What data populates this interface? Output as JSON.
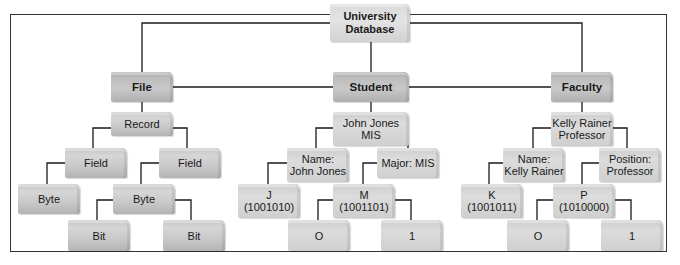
{
  "diagram": {
    "root": {
      "id": "root",
      "label": "University\nDatabase"
    },
    "nodes": {
      "file": {
        "label": "File"
      },
      "student": {
        "label": "Student"
      },
      "faculty": {
        "label": "Faculty"
      },
      "record": {
        "label": "Record"
      },
      "student_record": {
        "label": "John Jones\nMIS"
      },
      "faculty_record": {
        "label": "Kelly Rainer\nProfessor"
      },
      "field_left": {
        "label": "Field"
      },
      "field_right": {
        "label": "Field"
      },
      "student_name_field": {
        "label": "Name:\nJohn Jones"
      },
      "student_major_field": {
        "label": "Major: MIS"
      },
      "faculty_name_field": {
        "label": "Name:\nKelly Rainer"
      },
      "faculty_position_field": {
        "label": "Position:\nProfessor"
      },
      "byte_left": {
        "label": "Byte"
      },
      "byte_mid": {
        "label": "Byte"
      },
      "byte_j": {
        "label": "J\n(1001010)"
      },
      "byte_m": {
        "label": "M\n(1001101)"
      },
      "byte_k": {
        "label": "K\n(1001011)"
      },
      "byte_p": {
        "label": "P\n(1010000)"
      },
      "bit_left": {
        "label": "Bit"
      },
      "bit_right": {
        "label": "Bit"
      },
      "bit_m0": {
        "label": "O"
      },
      "bit_m1": {
        "label": "1"
      },
      "bit_p0": {
        "label": "O"
      },
      "bit_p1": {
        "label": "1"
      }
    },
    "edges": [
      [
        "root",
        "file"
      ],
      [
        "root",
        "student"
      ],
      [
        "root",
        "faculty"
      ],
      [
        "file",
        "record"
      ],
      [
        "record",
        "field_left"
      ],
      [
        "record",
        "field_right"
      ],
      [
        "field_left",
        "byte_left"
      ],
      [
        "field_right",
        "byte_mid"
      ],
      [
        "byte_mid",
        "bit_left"
      ],
      [
        "byte_mid",
        "bit_right"
      ],
      [
        "student",
        "student_record"
      ],
      [
        "student_record",
        "student_name_field"
      ],
      [
        "student_record",
        "student_major_field"
      ],
      [
        "student_name_field",
        "byte_j"
      ],
      [
        "student_major_field",
        "byte_m"
      ],
      [
        "byte_m",
        "bit_m0"
      ],
      [
        "byte_m",
        "bit_m1"
      ],
      [
        "faculty",
        "faculty_record"
      ],
      [
        "faculty_record",
        "faculty_name_field"
      ],
      [
        "faculty_record",
        "faculty_position_field"
      ],
      [
        "faculty_name_field",
        "byte_k"
      ],
      [
        "faculty_position_field",
        "byte_p"
      ],
      [
        "byte_p",
        "bit_p0"
      ],
      [
        "byte_p",
        "bit_p1"
      ]
    ],
    "colors": {
      "line": "#1a1a1a",
      "frame": "#333333",
      "box": "#c8c8c8"
    }
  }
}
